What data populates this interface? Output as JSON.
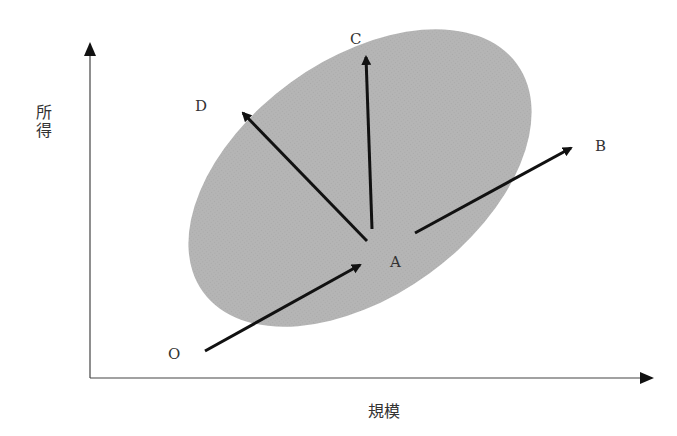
{
  "diagram": {
    "y_axis_label": "所得",
    "x_axis_label": "規模",
    "region": {
      "shape": "ellipse",
      "fill": "#b8b8b8",
      "cx": 360,
      "cy": 175,
      "rx": 195,
      "ry": 125,
      "rotation_deg": -36
    },
    "points": {
      "O": "O",
      "A": "A",
      "B": "B",
      "C": "C",
      "D": "D"
    },
    "arrows": [
      {
        "name": "O-to-A",
        "from": [
          205,
          351
        ],
        "to": [
          358,
          265
        ]
      },
      {
        "name": "A-to-B",
        "from": [
          415,
          233
        ],
        "to": [
          570,
          148
        ]
      },
      {
        "name": "A-to-C",
        "from": [
          372,
          229
        ],
        "to": [
          366,
          58
        ]
      },
      {
        "name": "A-to-D",
        "from": [
          367,
          241
        ],
        "to": [
          243,
          114
        ]
      }
    ],
    "colors": {
      "axis": "#444444",
      "arrow": "#111111",
      "region": "#b8b8b8",
      "text": "#333333"
    }
  }
}
